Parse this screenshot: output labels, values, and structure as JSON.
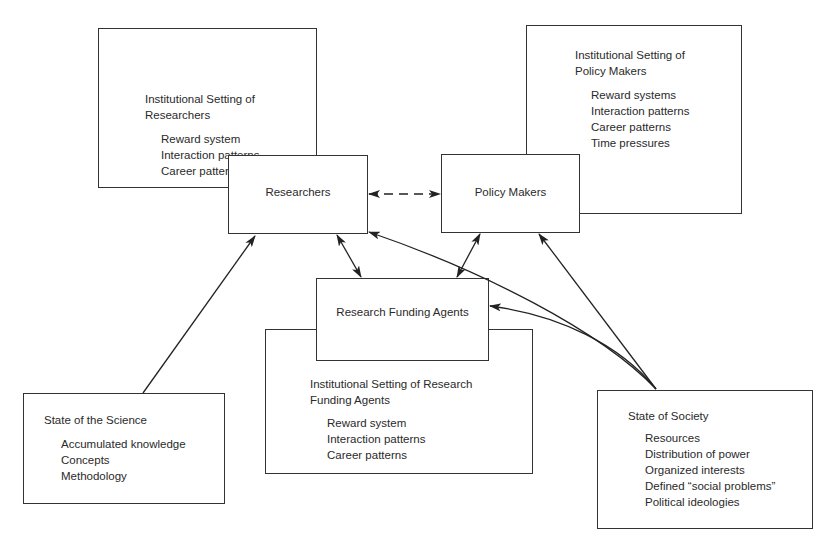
{
  "diagram": {
    "nodes": {
      "inst_researchers": {
        "title_line1": "Institutional Setting of",
        "title_line2": "Researchers",
        "items": [
          "Reward system",
          "Interaction patterns",
          "Career patterns"
        ]
      },
      "researchers": {
        "label": "Researchers"
      },
      "inst_policy_makers": {
        "title_line1": "Institutional Setting of",
        "title_line2": "Policy Makers",
        "items": [
          "Reward systems",
          "Interaction patterns",
          "Career patterns",
          "Time pressures"
        ]
      },
      "policy_makers": {
        "label": "Policy Makers"
      },
      "funding_agents": {
        "label": "Research Funding Agents"
      },
      "inst_funding_agents": {
        "title_line1": "Institutional Setting of Research",
        "title_line2": "Funding Agents",
        "items": [
          "Reward system",
          "Interaction patterns",
          "Career patterns"
        ]
      },
      "state_science": {
        "title": "State of the Science",
        "items": [
          "Accumulated knowledge",
          "Concepts",
          "Methodology"
        ]
      },
      "state_society": {
        "title": "State of Society",
        "items": [
          "Resources",
          "Distribution of power",
          "Organized interests",
          "Defined “social problems”",
          "Political ideologies"
        ]
      }
    },
    "edges": [
      {
        "from": "researchers",
        "to": "policy_makers",
        "style": "dashed",
        "direction": "both"
      },
      {
        "from": "researchers",
        "to": "funding_agents",
        "style": "solid",
        "direction": "both"
      },
      {
        "from": "policy_makers",
        "to": "funding_agents",
        "style": "solid",
        "direction": "both"
      },
      {
        "from": "state_science",
        "to": "researchers",
        "style": "solid",
        "direction": "forward"
      },
      {
        "from": "state_society",
        "to": "researchers",
        "style": "solid",
        "direction": "forward"
      },
      {
        "from": "state_society",
        "to": "policy_makers",
        "style": "solid",
        "direction": "forward"
      },
      {
        "from": "state_society",
        "to": "funding_agents",
        "style": "solid",
        "direction": "forward"
      }
    ]
  }
}
